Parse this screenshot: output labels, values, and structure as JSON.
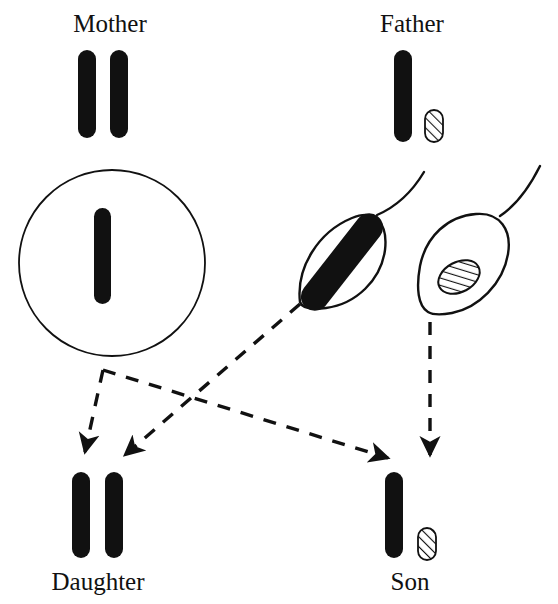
{
  "figure": {
    "background_color": "#ffffff",
    "ink_color": "#111111",
    "chromosome_fill_black": "#111111",
    "chromosome_fill_hatched": "#ffffff",
    "hatch_stroke_color": "#111111"
  },
  "labels": {
    "mother": "Mother",
    "father": "Father",
    "daughter": "Daughter",
    "son": "Son"
  },
  "parents": {
    "mother": {
      "label": "Mother",
      "label_x": 110,
      "label_y": 32,
      "chromosomes": [
        {
          "name": "X",
          "style": "solid",
          "x": 78,
          "y": 50,
          "w": 18,
          "h": 88
        },
        {
          "name": "X",
          "style": "solid",
          "x": 110,
          "y": 50,
          "w": 18,
          "h": 88
        }
      ]
    },
    "father": {
      "label": "Father",
      "label_x": 412,
      "label_y": 32,
      "chromosomes": [
        {
          "name": "X",
          "style": "solid",
          "x": 394,
          "y": 50,
          "w": 18,
          "h": 92
        },
        {
          "name": "Y",
          "style": "hatched",
          "x": 425,
          "y": 110,
          "w": 18,
          "h": 32
        }
      ]
    }
  },
  "gametes": {
    "egg": {
      "name": "egg-cell",
      "shape": "circle",
      "cx": 112,
      "cy": 263,
      "r": 93,
      "chromosome": {
        "name": "X",
        "style": "solid",
        "x": 94,
        "y": 208,
        "w": 17,
        "h": 96
      }
    },
    "sperm_x": {
      "name": "sperm-cell-x",
      "shape": "leaf",
      "chromosome": {
        "name": "X",
        "style": "solid"
      }
    },
    "sperm_y": {
      "name": "sperm-cell-y",
      "shape": "leaf",
      "chromosome": {
        "name": "Y",
        "style": "hatched"
      }
    }
  },
  "offspring": {
    "daughter": {
      "label": "Daughter",
      "label_x": 98,
      "label_y": 590,
      "genotype": "XX",
      "chromosomes": [
        {
          "name": "X",
          "style": "solid",
          "x": 72,
          "y": 472,
          "w": 18,
          "h": 86
        },
        {
          "name": "X",
          "style": "solid",
          "x": 105,
          "y": 472,
          "w": 18,
          "h": 86
        }
      ]
    },
    "son": {
      "label": "Son",
      "label_x": 410,
      "label_y": 590,
      "genotype": "XY",
      "chromosomes": [
        {
          "name": "X",
          "style": "solid",
          "x": 385,
          "y": 472,
          "w": 18,
          "h": 86
        },
        {
          "name": "Y",
          "style": "hatched",
          "x": 418,
          "y": 528,
          "w": 18,
          "h": 32
        }
      ]
    }
  },
  "arrows": [
    {
      "name": "egg-to-daughter",
      "from": "egg",
      "to": "daughter",
      "style": "dashed"
    },
    {
      "name": "egg-to-son",
      "from": "egg",
      "to": "son",
      "style": "dashed"
    },
    {
      "name": "sperm-x-to-daughter",
      "from": "sperm_x",
      "to": "daughter",
      "style": "dashed"
    },
    {
      "name": "sperm-y-to-son",
      "from": "sperm_y",
      "to": "son",
      "style": "dashed"
    }
  ]
}
